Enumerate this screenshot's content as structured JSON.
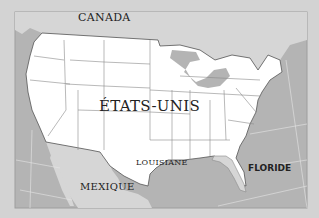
{
  "map": {
    "labels": {
      "canada": "CANADA",
      "united_states": "ÉTATS-UNIS",
      "louisiane": "LOUISIANE",
      "mexique": "MEXIQUE",
      "floride": "FLORIDE"
    },
    "highlighted_state": "FLORIDE",
    "colors": {
      "background": "#d3d3d3",
      "sea": "#b4b4b4",
      "neighbor_land": "#d6d6d6",
      "usa_land": "#ffffff",
      "highlight": "#d6d6d6",
      "border_line": "#555555",
      "state_line": "#8a8a8a",
      "graticule": "#e6e6e6"
    }
  }
}
